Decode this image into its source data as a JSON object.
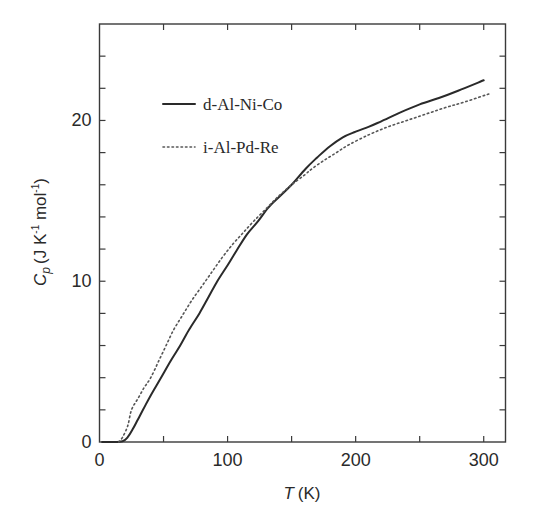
{
  "chart_data": {
    "type": "line",
    "title": "",
    "xlabel": "T (K)",
    "xlabel_italic_part": "T",
    "xlabel_unit_part": "(K)",
    "ylabel": "Cp (J K-1 mol-1)",
    "ylabel_parts": {
      "symbol": "C",
      "subscript": "p",
      "unit": "(J K",
      "exp1": "-1",
      "unit2": " mol",
      "exp2": "-1",
      "close": ")"
    },
    "xlim": [
      0,
      317
    ],
    "ylim": [
      0,
      26
    ],
    "xticks": [
      0,
      100,
      200,
      300
    ],
    "xticks_minor": [
      50,
      150,
      250
    ],
    "yticks": [
      0,
      10,
      20
    ],
    "yticks_minor": [
      2,
      4,
      6,
      8,
      12,
      14,
      16,
      18,
      22,
      24
    ],
    "grid": false,
    "legend_position": "upper-left inside",
    "series": [
      {
        "name": "d-Al-Ni-Co",
        "style": "solid",
        "color": "#2a2a2a",
        "x": [
          2,
          10,
          18,
          22,
          26,
          30,
          34,
          40,
          48,
          56,
          63,
          70,
          78,
          85,
          92,
          100,
          107,
          115,
          124,
          132,
          141,
          150,
          161,
          170,
          180,
          190,
          200,
          210,
          220,
          235,
          250,
          265,
          280,
          300
        ],
        "y": [
          0.0,
          0.0,
          0.05,
          0.3,
          0.8,
          1.4,
          2.0,
          2.9,
          4.0,
          5.1,
          6.0,
          7.0,
          8.0,
          9.0,
          10.0,
          11.0,
          11.9,
          12.9,
          13.75,
          14.6,
          15.3,
          16.0,
          17.0,
          17.7,
          18.4,
          18.95,
          19.3,
          19.6,
          19.95,
          20.5,
          21.0,
          21.4,
          21.85,
          22.5
        ]
      },
      {
        "name": "i-Al-Pd-Re",
        "style": "dotted",
        "color": "#555555",
        "x": [
          15,
          18,
          22,
          25,
          30,
          35,
          40,
          46,
          52,
          58,
          65,
          72,
          80,
          88,
          96,
          104,
          112,
          120,
          130,
          140,
          150,
          160,
          166,
          175,
          185,
          195,
          210,
          225,
          240,
          255,
          270,
          285,
          306
        ],
        "y": [
          0.0,
          0.3,
          1.0,
          2.0,
          2.7,
          3.4,
          4.0,
          5.0,
          6.0,
          7.0,
          7.9,
          8.8,
          9.7,
          10.6,
          11.5,
          12.3,
          13.0,
          13.7,
          14.5,
          15.3,
          16.0,
          16.6,
          17.0,
          17.5,
          18.0,
          18.5,
          19.1,
          19.6,
          20.0,
          20.4,
          20.8,
          21.15,
          21.7
        ]
      }
    ]
  }
}
